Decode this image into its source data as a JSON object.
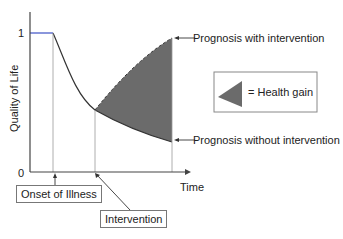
{
  "diagram": {
    "y_axis": {
      "label": "Quality of Life",
      "tick_top": "1",
      "tick_bottom": "0"
    },
    "x_axis": {
      "label": "Time"
    },
    "annotations": {
      "with_intervention": "Prognosis with intervention",
      "without_intervention": "Prognosis without intervention",
      "onset": "Onset of Illness",
      "intervention": "Intervention"
    },
    "legend": {
      "symbol": "triangle-shape",
      "label": "= Health gain"
    },
    "colors": {
      "fill": "#6b6b6b",
      "baseline": "#3b4fc4",
      "line": "#333333",
      "guide": "#999999"
    }
  }
}
